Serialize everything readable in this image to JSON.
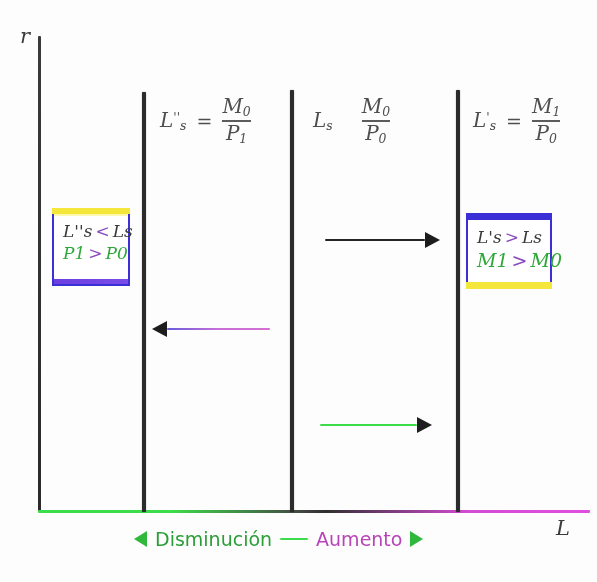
{
  "figure": {
    "axes": {
      "y_label": "r",
      "x_label": "L"
    },
    "colors": {
      "green": "#3ddc4a",
      "magenta": "#d44bd4",
      "ink": "#2b2b2b",
      "box_blue": "#3b2fd6",
      "box_yellow": "#f5e63c",
      "box_purple": "#6b3fe0"
    }
  },
  "supply_curves": [
    {
      "name": "ls-contracted",
      "formula": {
        "lhs_base": "L",
        "lhs_prime": "''",
        "lhs_sub": "s",
        "numerator": "M",
        "numerator_sub": "0",
        "denominator": "P",
        "denominator_sub": "1"
      }
    },
    {
      "name": "ls-initial",
      "formula": {
        "lhs_base": "L",
        "lhs_prime": "",
        "lhs_sub": "s",
        "numerator": "M",
        "numerator_sub": "0",
        "denominator": "P",
        "denominator_sub": "0"
      }
    },
    {
      "name": "ls-expanded",
      "formula": {
        "lhs_base": "L",
        "lhs_prime": "'",
        "lhs_sub": "s",
        "numerator": "M",
        "numerator_sub": "1",
        "denominator": "P",
        "denominator_sub": "0"
      }
    }
  ],
  "notes": {
    "left": {
      "line1_left": "L''s",
      "line1_rel": "<",
      "line1_right": "Ls",
      "line2_left": "P1",
      "line2_rel": ">",
      "line2_right": "P0"
    },
    "right": {
      "line1_left": "L's",
      "line1_rel": ">",
      "line1_right": "Ls",
      "line2_left": "M1",
      "line2_rel": ">",
      "line2_right": "M0"
    }
  },
  "arrows": [
    {
      "name": "arrow-expansion-black",
      "direction": "right",
      "color": "#262626"
    },
    {
      "name": "arrow-contraction-black",
      "direction": "left",
      "color": "#262626"
    },
    {
      "name": "arrow-expansion-green",
      "direction": "right",
      "color": "#3ddc4a"
    }
  ],
  "legend": {
    "left_arrow_glyph": "◄",
    "decrease_label": "Disminución",
    "separator_glyph": "—",
    "increase_label": "Aumento",
    "right_arrow_glyph": "►"
  }
}
